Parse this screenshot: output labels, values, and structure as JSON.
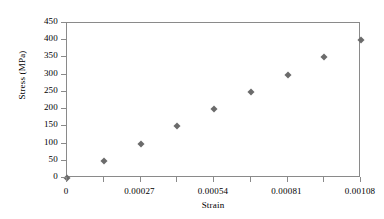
{
  "chart_data": {
    "type": "scatter",
    "title": "",
    "xlabel": "Strain",
    "ylabel": "Stress (MPa)",
    "xlim": [
      0,
      0.00108
    ],
    "ylim": [
      0,
      450
    ],
    "grid": false,
    "legend": null,
    "marker": "diamond",
    "marker_color": "#6b6b6b",
    "axis_color": "#8a8a8a",
    "x_tick_labels": [
      "0",
      "0.00027",
      "0.00054",
      "0.00081",
      "0.00108"
    ],
    "x_tick_values": [
      0,
      0.00027,
      0.00054,
      0.00081,
      0.00108
    ],
    "x_minor_tick_values": [
      0.000135,
      0.000405,
      0.000675,
      0.000945
    ],
    "y_tick_labels": [
      "0",
      "50",
      "100",
      "150",
      "200",
      "250",
      "300",
      "350",
      "400",
      "450"
    ],
    "y_tick_values": [
      0,
      50,
      100,
      150,
      200,
      250,
      300,
      350,
      400,
      450
    ],
    "x": [
      0,
      0.000135,
      0.00027,
      0.000405,
      0.00054,
      0.000675,
      0.00081,
      0.000945,
      0.00108
    ],
    "y": [
      0,
      50,
      100,
      150,
      200,
      250,
      300,
      350,
      400
    ],
    "points": [
      {
        "x": 0,
        "y": 0
      },
      {
        "x": 0.000135,
        "y": 50
      },
      {
        "x": 0.00027,
        "y": 100
      },
      {
        "x": 0.000405,
        "y": 150
      },
      {
        "x": 0.00054,
        "y": 200
      },
      {
        "x": 0.000675,
        "y": 250
      },
      {
        "x": 0.00081,
        "y": 300
      },
      {
        "x": 0.000945,
        "y": 350
      },
      {
        "x": 0.00108,
        "y": 400
      }
    ]
  }
}
